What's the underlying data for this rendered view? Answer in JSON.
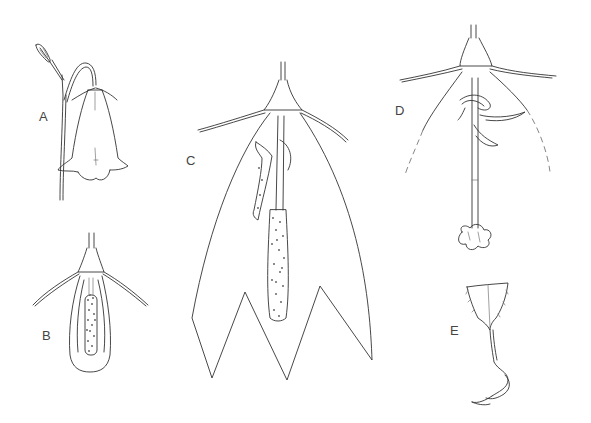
{
  "figure": {
    "type": "botanical-illustration",
    "panels": [
      {
        "id": "A",
        "label": "A",
        "description": "whole nodding bell-shaped flower on stem with bud"
      },
      {
        "id": "B",
        "label": "B",
        "description": "young flower with petals removed showing style enclosed by anthers"
      },
      {
        "id": "C",
        "label": "C",
        "description": "longitudinal view of open corolla with style and shed anthers"
      },
      {
        "id": "D",
        "label": "D",
        "description": "older flower with withered anthers and three-lobed stigma"
      },
      {
        "id": "E",
        "label": "E",
        "description": "single stamen with broad hairy filament base"
      }
    ],
    "colors": {
      "background": "#ffffff",
      "ink": "#333333"
    }
  }
}
